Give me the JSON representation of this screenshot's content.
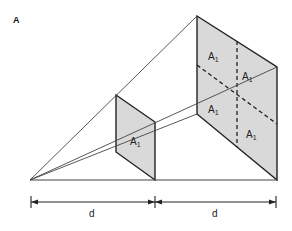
{
  "figure": {
    "panel_label": "A",
    "area_label": "A",
    "area_subscript": "1",
    "distance_label_1": "d",
    "distance_label_2": "d",
    "colors": {
      "fill": "#d9d9d9",
      "stroke": "#222222",
      "ray": "#444444"
    },
    "small_square_labels": [
      "A1"
    ],
    "large_square_labels": [
      "A1",
      "A1",
      "A1",
      "A1"
    ]
  }
}
